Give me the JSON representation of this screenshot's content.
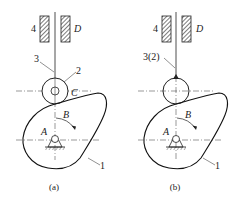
{
  "figures": [
    {
      "id": "a",
      "caption": "(a)",
      "labels": {
        "guide_left": "4",
        "guide_right": "D",
        "follower": "3",
        "roller": "2",
        "roller_center": "C",
        "cam_pivot": "A",
        "rotation": "B",
        "cam": "1"
      }
    },
    {
      "id": "b",
      "caption": "(b)",
      "labels": {
        "guide_left": "4",
        "guide_right": "D",
        "follower": "3(2)",
        "roller_center": "",
        "cam_pivot": "A",
        "rotation": "B",
        "cam": "1"
      }
    }
  ],
  "colors": {
    "line": "#1a1a1a",
    "hatch": "#555555"
  }
}
